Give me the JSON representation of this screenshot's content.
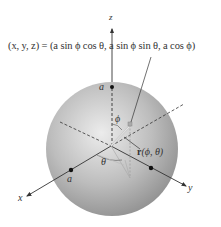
{
  "figure": {
    "formula": "(x, y, z) = (a sin ϕ cos θ, a sin ϕ sin θ, a cos ϕ)",
    "axes": {
      "x_label": "x",
      "y_label": "y",
      "z_label": "z"
    },
    "points": {
      "a_on_z": "a",
      "a_on_x": "a"
    },
    "angles": {
      "phi": "ϕ",
      "theta": "θ"
    },
    "vector": {
      "name": "r",
      "args": "(ϕ, θ)"
    },
    "colors": {
      "sphere_light": "#e6e6e6",
      "sphere_dark": "#8c8c8c",
      "line": "#333333",
      "projection": "#b0b0b0"
    }
  }
}
